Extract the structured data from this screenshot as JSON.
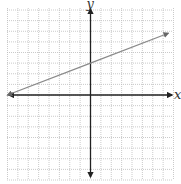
{
  "chart_data": {
    "type": "line",
    "title": "",
    "xlabel": "x",
    "ylabel": "y",
    "xlim": [
      -8,
      8
    ],
    "ylim": [
      -8,
      8
    ],
    "grid": true,
    "grid_step": 1,
    "legend": null,
    "series": [
      {
        "name": "line",
        "equation": "y = (3/8)x + 3",
        "x": [
          -8,
          0,
          7.5
        ],
        "y": [
          0,
          3,
          5.8125
        ],
        "arrows": "both",
        "color": "#8a8a8a"
      }
    ]
  },
  "labels": {
    "x_axis": "x",
    "y_axis": "y"
  },
  "colors": {
    "grid": "#bdbdbd",
    "axis": "#222222",
    "line": "#8a8a8a"
  }
}
